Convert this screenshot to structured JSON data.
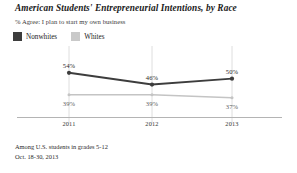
{
  "chart_data": {
    "type": "line",
    "title": "American Students' Entrepreneurial Intentions, by Race",
    "subtitle": "% Agree: I plan to start my own business",
    "xlabel": "",
    "ylabel": "",
    "categories": [
      "2011",
      "2012",
      "2013"
    ],
    "series": [
      {
        "name": "Nonwhites",
        "color": "#3d3d3d",
        "values": [
          54,
          46,
          50
        ],
        "labels": [
          "54%",
          "46%",
          "50%"
        ]
      },
      {
        "name": "Whites",
        "color": "#c9c9c9",
        "values": [
          39,
          39,
          37
        ],
        "labels": [
          "39%",
          "39%",
          "37%"
        ]
      }
    ],
    "ylim": [
      30,
      60
    ],
    "grid": "vertical",
    "legend_position": "top-left",
    "notes": [
      "Among U.S. students in grades 5-12",
      "Oct. 18-30, 2013"
    ]
  },
  "legend": {
    "items": [
      {
        "label": "Nonwhites"
      },
      {
        "label": "Whites"
      }
    ]
  },
  "footer": {
    "line1": "Among U.S. students in grades 5-12",
    "line2": "Oct. 18-30, 2013"
  }
}
